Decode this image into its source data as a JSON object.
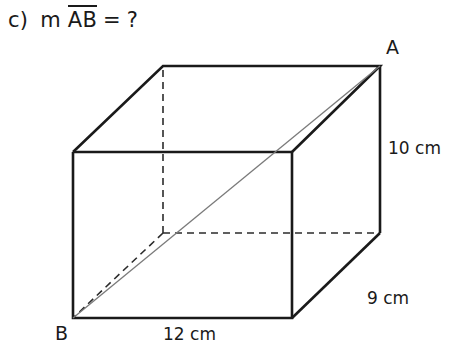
{
  "problem": {
    "item_label": "c)",
    "measure_symbol": "m",
    "segment": "AB",
    "equals": "=",
    "unknown": "?"
  },
  "figure": {
    "shape": "rectangular-prism",
    "stroke_color": "#1a1a1a",
    "diagonal_color": "#7a7a7a",
    "hidden_edge_style": "dashed",
    "vertices": {
      "A": {
        "label": "A",
        "x": 380,
        "y": 66
      },
      "B": {
        "label": "B",
        "x": 73,
        "y": 318
      }
    },
    "dimensions": [
      {
        "name": "height",
        "value": 10,
        "unit": "cm",
        "text": "10 cm"
      },
      {
        "name": "depth",
        "value": 9,
        "unit": "cm",
        "text": "9 cm"
      },
      {
        "name": "width",
        "value": 12,
        "unit": "cm",
        "text": "12 cm"
      }
    ],
    "labels": {
      "height": "10 cm",
      "depth": "9 cm",
      "width": "12 cm"
    },
    "geometry": {
      "front_top_left": "73,152",
      "front_top_right": "292,152",
      "front_bottom_right": "292,318",
      "front_bottom_left": "73,318",
      "back_top_left": "163,66",
      "back_top_right": "380,66",
      "back_bottom_right": "380,233",
      "back_bottom_left": "163,233",
      "front_face": "73,152 292,152 292,318 73,318",
      "top_face": "73,152 163,66 380,66 292,152",
      "right_face": "292,152 380,66 380,233 292,318",
      "diagonal_AB": "73,318 380,66"
    }
  }
}
